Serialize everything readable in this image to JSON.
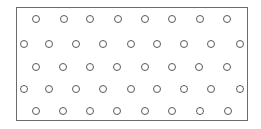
{
  "diagram": {
    "frame": {
      "x": 16,
      "y": 7,
      "width": 232,
      "height": 114,
      "stroke": "#6b6b6b",
      "fill": "#ffffff"
    },
    "circle": {
      "diameter": 8,
      "stroke": "#5a5a5a",
      "fill": "#ffffff"
    },
    "rows": [
      {
        "y": 19,
        "x": [
          36,
          64,
          90,
          118,
          145,
          172,
          200,
          227
        ]
      },
      {
        "y": 44,
        "x": [
          24,
          49,
          76,
          103,
          131,
          157,
          184,
          211,
          240
        ]
      },
      {
        "y": 67,
        "x": [
          36,
          63,
          90,
          117,
          145,
          172,
          199,
          227
        ]
      },
      {
        "y": 89,
        "x": [
          24,
          49,
          76,
          103,
          131,
          157,
          184,
          211,
          240
        ]
      },
      {
        "y": 111,
        "x": [
          36,
          63,
          90,
          117,
          145,
          172,
          200,
          228
        ]
      }
    ],
    "counts": {
      "rows": 5,
      "total_circles": 42
    }
  }
}
